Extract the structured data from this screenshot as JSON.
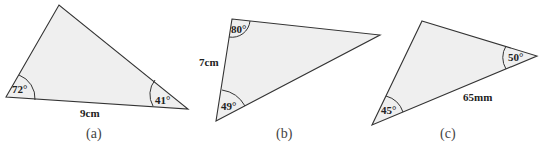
{
  "figures": [
    {
      "id": "a",
      "caption": "(a)",
      "angles": [
        "72°",
        "41°"
      ],
      "side": "9cm"
    },
    {
      "id": "b",
      "caption": "(b)",
      "angles": [
        "80°",
        "49°"
      ],
      "side": "7cm"
    },
    {
      "id": "c",
      "caption": "(c)",
      "angles": [
        "50°",
        "45°"
      ],
      "side": "65mm"
    }
  ]
}
